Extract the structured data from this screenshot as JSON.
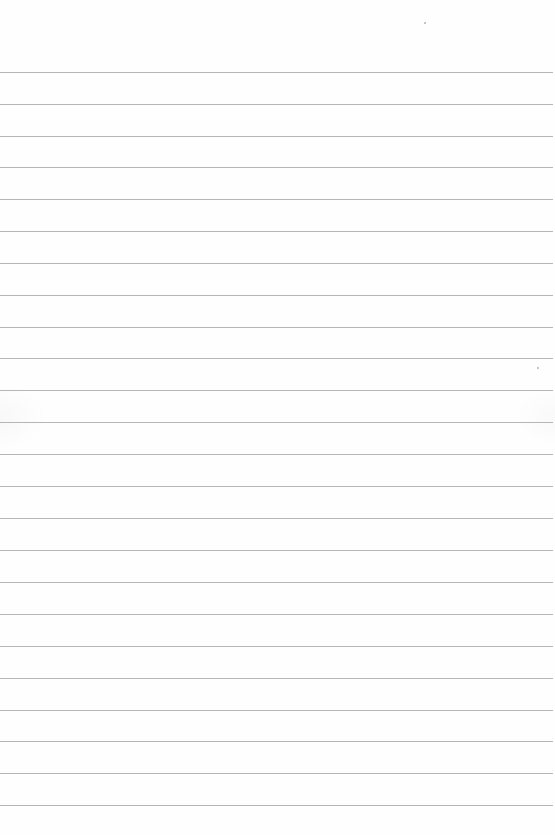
{
  "document": {
    "type": "ruled-paper",
    "background_color": "#fefefe",
    "rule_color": "#a9a9a9",
    "rule_count": 24,
    "rules": [
      {
        "y": 72,
        "x_end": 553
      },
      {
        "y": 104,
        "x_end": 553
      },
      {
        "y": 136,
        "x_end": 553
      },
      {
        "y": 167,
        "x_end": 553
      },
      {
        "y": 199,
        "x_end": 553
      },
      {
        "y": 231,
        "x_end": 553
      },
      {
        "y": 263,
        "x_end": 553
      },
      {
        "y": 295,
        "x_end": 553
      },
      {
        "y": 327,
        "x_end": 553
      },
      {
        "y": 358,
        "x_end": 553
      },
      {
        "y": 390,
        "x_end": 553
      },
      {
        "y": 422,
        "x_end": 553
      },
      {
        "y": 454,
        "x_end": 553
      },
      {
        "y": 486,
        "x_end": 553
      },
      {
        "y": 518,
        "x_end": 553
      },
      {
        "y": 550,
        "x_end": 553
      },
      {
        "y": 582,
        "x_end": 553
      },
      {
        "y": 614,
        "x_end": 553
      },
      {
        "y": 646,
        "x_end": 553
      },
      {
        "y": 678,
        "x_end": 553
      },
      {
        "y": 710,
        "x_end": 553
      },
      {
        "y": 741,
        "x_end": 553
      },
      {
        "y": 773,
        "x_end": 553
      },
      {
        "y": 805,
        "x_end": 553
      }
    ],
    "specks": [
      {
        "x": 424,
        "y": 22
      },
      {
        "x": 537,
        "y": 367
      }
    ]
  }
}
